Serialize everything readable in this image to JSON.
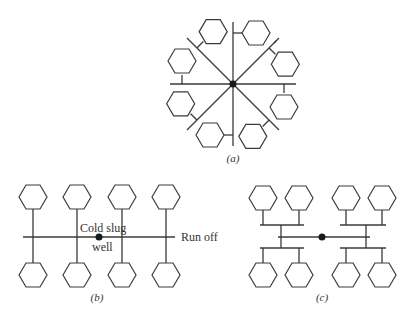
{
  "figure": {
    "panels": [
      {
        "id": "a",
        "caption": "(a)",
        "layout": "radial",
        "cavities": 8
      },
      {
        "id": "b",
        "caption": "(b)",
        "layout": "linear",
        "cavities": 8
      },
      {
        "id": "c",
        "caption": "(c)",
        "layout": "H-branch",
        "cavities": 8
      }
    ],
    "labels": {
      "cold_slug_line1": "Cold slug",
      "cold_slug_line2": "well",
      "run_off": "Run off"
    },
    "colors": {
      "line": "#3a3a3a",
      "dot": "#1a1a1a",
      "background": "#ffffff"
    }
  }
}
